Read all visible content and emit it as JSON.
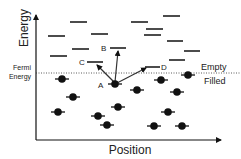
{
  "diagram": {
    "title": "",
    "axes": {
      "y_label": "Energy",
      "x_label": "Position"
    },
    "fermi": {
      "label_line1": "Fermi",
      "label_line2": "Energy",
      "above_label": "Empty",
      "below_label": "Filled"
    },
    "points": {
      "A": "A",
      "B": "B",
      "C": "C",
      "D": "D"
    },
    "colors": {
      "ink": "#111111",
      "text": "#222222",
      "background": "#ffffff"
    },
    "empty_levels": [
      {
        "x1": 48,
        "x2": 65,
        "y": 36
      },
      {
        "x1": 70,
        "x2": 87,
        "y": 22
      },
      {
        "x1": 50,
        "x2": 67,
        "y": 56
      },
      {
        "x1": 72,
        "x2": 89,
        "y": 49
      },
      {
        "x1": 91,
        "x2": 108,
        "y": 34
      },
      {
        "x1": 131,
        "x2": 148,
        "y": 22
      },
      {
        "x1": 163,
        "x2": 180,
        "y": 16
      },
      {
        "x1": 146,
        "x2": 163,
        "y": 29
      },
      {
        "x1": 144,
        "x2": 161,
        "y": 35
      },
      {
        "x1": 167,
        "x2": 183,
        "y": 41
      },
      {
        "x1": 184,
        "x2": 200,
        "y": 51
      },
      {
        "x1": 169,
        "x2": 185,
        "y": 60
      }
    ],
    "labeled_levels": [
      {
        "id": "C",
        "x1": 87,
        "x2": 103,
        "y": 62
      },
      {
        "id": "B",
        "x1": 110,
        "x2": 126,
        "y": 48
      },
      {
        "id": "D",
        "x1": 145,
        "x2": 160,
        "y": 67
      }
    ],
    "filled_electrons": [
      {
        "x": 62,
        "y": 79
      },
      {
        "x": 73,
        "y": 97
      },
      {
        "x": 58,
        "y": 112
      },
      {
        "x": 98,
        "y": 116
      },
      {
        "x": 107,
        "y": 125
      },
      {
        "x": 118,
        "y": 107
      },
      {
        "x": 161,
        "y": 80
      },
      {
        "x": 188,
        "y": 75
      },
      {
        "x": 137,
        "y": 90
      },
      {
        "x": 177,
        "y": 92
      },
      {
        "x": 168,
        "y": 112
      },
      {
        "x": 154,
        "y": 126
      },
      {
        "x": 182,
        "y": 126
      }
    ],
    "electron_A": {
      "x": 115,
      "y": 84
    }
  }
}
